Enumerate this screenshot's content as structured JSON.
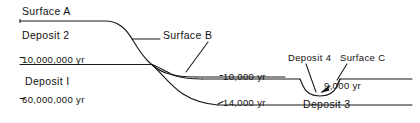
{
  "diagram": {
    "background_color": "#ffffff",
    "line_color": "#1a1a1a",
    "labels": {
      "surface_a": "Surface A",
      "surface_b": "Surface B",
      "surface_c": "Surface C",
      "deposit_1": "Deposit I",
      "deposit_2": "Deposit 2",
      "deposit_3": "Deposit 3",
      "deposit_4": "Deposit 4",
      "age_10000000": "10,000,000 yr",
      "age_60000000": "60,000,000 yr",
      "age_10000": "10,000 yr",
      "age_14000": "14,000 yr",
      "age_9000": "9,000 yr"
    },
    "tick_prefix": "-",
    "units": "yr"
  }
}
